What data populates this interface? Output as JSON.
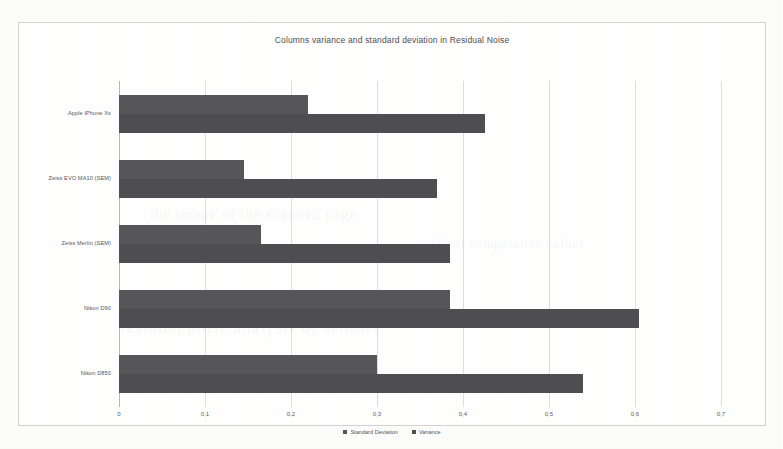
{
  "chart_data": {
    "type": "bar",
    "orientation": "horizontal",
    "title": "Columns variance and standard deviation in Residual Noise",
    "xlabel": "",
    "ylabel": "",
    "xlim": [
      0,
      0.7
    ],
    "grid": true,
    "legend_position": "bottom-center",
    "decimal_separator": ",",
    "categories": [
      "Apple iPhone Xs",
      "Zeiss EVO MA10 (SEM)",
      "Zeiss Merlin (SEM)",
      "Nikon D90",
      "Nikon D850"
    ],
    "series": [
      {
        "name": "Standard Deviation",
        "color": "#565659",
        "values": [
          0.22,
          0.145,
          0.165,
          0.385,
          0.3
        ]
      },
      {
        "name": "Variance",
        "color": "#4e4e51",
        "values": [
          0.425,
          0.37,
          0.385,
          0.605,
          0.54
        ]
      }
    ],
    "xticks": [
      {
        "value": 0,
        "label": "0"
      },
      {
        "value": 0.1,
        "label": "0,1"
      },
      {
        "value": 0.2,
        "label": "0,2"
      },
      {
        "value": 0.3,
        "label": "0,3"
      },
      {
        "value": 0.4,
        "label": "0,4"
      },
      {
        "value": 0.5,
        "label": "0,5"
      },
      {
        "value": 0.6,
        "label": "0,6"
      },
      {
        "value": 0.7,
        "label": "0,7"
      }
    ]
  },
  "page": {
    "background_ghost_text": [
      "the image of the scanned page",
      "residual noise analysis of sensors",
      "table of comparative values"
    ]
  }
}
